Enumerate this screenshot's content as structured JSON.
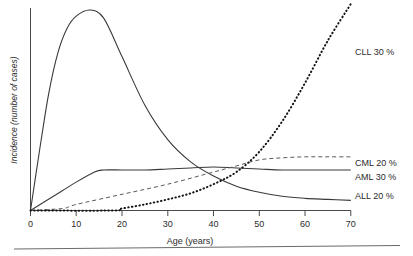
{
  "chart_data": {
    "type": "line",
    "title": "",
    "xlabel": "Age (years)",
    "ylabel": "Incidence (number of cases)",
    "xlim": [
      0,
      70
    ],
    "ylim": [
      0,
      100
    ],
    "grid": false,
    "legend_position": "right-of-plot-end-labels",
    "xticks": [
      0,
      10,
      20,
      30,
      40,
      50,
      60,
      70
    ],
    "xtick_labels": [
      "0",
      "10",
      "20",
      "30",
      "40",
      "50",
      "60",
      "70"
    ],
    "yticks": [],
    "ytick_labels": [],
    "series": [
      {
        "name": "ALL 20 %",
        "label": "ALL 20 %",
        "style": "solid",
        "x": [
          0,
          2,
          4,
          6,
          8,
          10,
          13,
          16,
          20,
          25,
          30,
          35,
          40,
          45,
          50,
          55,
          60,
          65,
          70
        ],
        "values": [
          0,
          30,
          58,
          78,
          90,
          96,
          99,
          95,
          76,
          52,
          35,
          24,
          17,
          12,
          9,
          7,
          6,
          5.5,
          5
        ]
      },
      {
        "name": "AML 30 %",
        "label": "AML 30 %",
        "style": "solid",
        "x": [
          0,
          5,
          10,
          14,
          16,
          20,
          25,
          30,
          35,
          40,
          45,
          50,
          55,
          60,
          65,
          70
        ],
        "values": [
          0,
          7,
          14,
          19,
          20,
          20,
          20,
          20.5,
          21,
          21.5,
          21,
          20.5,
          20,
          20,
          20,
          20
        ]
      },
      {
        "name": "CML 20 %",
        "label": "CML 20 %",
        "style": "dashed",
        "x": [
          0,
          7,
          10,
          20,
          30,
          40,
          45,
          50,
          55,
          60,
          65,
          70
        ],
        "values": [
          0,
          1,
          3,
          8,
          13,
          19,
          22,
          25,
          26,
          26.5,
          26.5,
          26.5
        ]
      },
      {
        "name": "CLL 30 %",
        "label": "CLL 30 %",
        "style": "dotted",
        "x": [
          0,
          18,
          20,
          25,
          30,
          35,
          40,
          45,
          50,
          55,
          60,
          65,
          70
        ],
        "values": [
          0,
          0,
          1,
          3,
          5.5,
          8.5,
          13,
          19,
          29,
          44,
          63,
          84,
          102
        ]
      }
    ]
  },
  "axes": {
    "x_title": "Age (years)",
    "y_title": "Incidence (number of cases)",
    "x_tick_0": "0",
    "x_tick_10": "10",
    "x_tick_20": "20",
    "x_tick_30": "30",
    "x_tick_40": "40",
    "x_tick_50": "50",
    "x_tick_60": "60",
    "x_tick_70": "70"
  },
  "labels": {
    "cll": "CLL 30 %",
    "cml": "CML 20 %",
    "aml": "AML 30 %",
    "all": "ALL 20 %"
  },
  "colors": {
    "axis": "#4a4a4a",
    "curve_solid": "#3a3a3a",
    "curve_dashed": "#5a5a5a",
    "curve_dotted": "#141414",
    "text": "#2b2b2b",
    "background": "#ffffff"
  }
}
